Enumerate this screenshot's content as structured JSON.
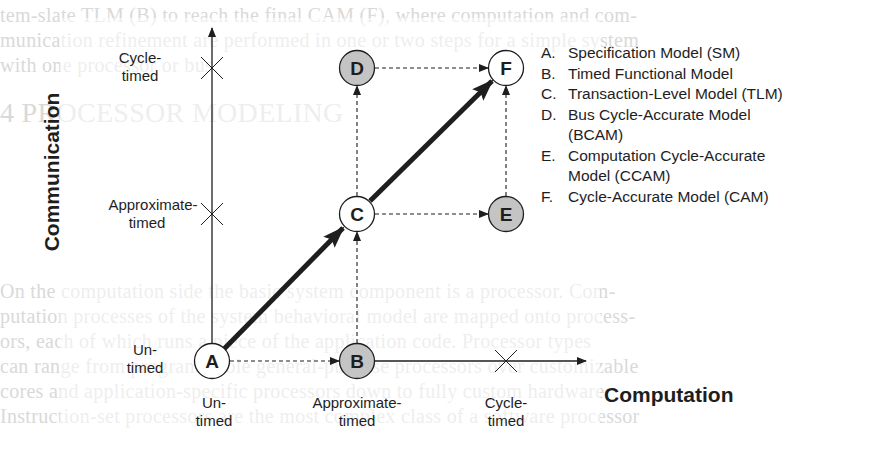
{
  "background_text": {
    "lines": [
      {
        "y": 3,
        "text": "tem-slate TLM (B) to reach the final CAM (F), where computation and com-"
      },
      {
        "y": 28,
        "text": "munication refinement are performed in one or two steps for a simple system"
      },
      {
        "y": 53,
        "text": "with one processor or bus."
      },
      {
        "y": 100,
        "text": "4    PROCESSOR MODELING"
      },
      {
        "y": 279,
        "text": "On the computation side the basic system component is a processor. Com-"
      },
      {
        "y": 304,
        "text": "putation processes of the system behavioral model are mapped onto process-"
      },
      {
        "y": 329,
        "text": "ors, each of which runs a piece of the application code. Processor types"
      },
      {
        "y": 354,
        "text": "can range from programmable general-purpose processors over customizable"
      },
      {
        "y": 379,
        "text": "cores and application-specific processors down to fully custom hardware."
      },
      {
        "y": 404,
        "text": "Instruction-set processors are the most complex class of a software processor"
      }
    ]
  },
  "axes": {
    "y_title": "Communication",
    "x_title": "Computation",
    "y_ticks": [
      {
        "line1": "Cycle-",
        "line2": "timed"
      },
      {
        "line1": "Approximate-",
        "line2": "timed"
      },
      {
        "line1": "Un-",
        "line2": "timed"
      }
    ],
    "x_ticks": [
      {
        "line1": "Un-",
        "line2": "timed"
      },
      {
        "line1": "Approximate-",
        "line2": "timed"
      },
      {
        "line1": "Cycle-",
        "line2": "timed"
      }
    ]
  },
  "nodes": [
    {
      "id": "A",
      "label": "A",
      "fill": "#ffffff"
    },
    {
      "id": "B",
      "label": "B",
      "fill": "#c4c4c4"
    },
    {
      "id": "C",
      "label": "C",
      "fill": "#ffffff"
    },
    {
      "id": "D",
      "label": "D",
      "fill": "#c4c4c4"
    },
    {
      "id": "E",
      "label": "E",
      "fill": "#c4c4c4"
    },
    {
      "id": "F",
      "label": "F",
      "fill": "#ffffff"
    }
  ],
  "edges": [
    {
      "from": "A",
      "to": "C",
      "style": "bold"
    },
    {
      "from": "C",
      "to": "F",
      "style": "bold"
    },
    {
      "from": "A",
      "to": "B",
      "style": "dashed"
    },
    {
      "from": "B",
      "to": "C",
      "style": "dashed"
    },
    {
      "from": "C",
      "to": "D",
      "style": "dashed"
    },
    {
      "from": "C",
      "to": "E",
      "style": "dashed"
    },
    {
      "from": "D",
      "to": "F",
      "style": "dashed"
    },
    {
      "from": "E",
      "to": "F",
      "style": "dashed"
    }
  ],
  "legend": [
    {
      "key": "A.",
      "text": "Specification Model (SM)"
    },
    {
      "key": "B.",
      "text": "Timed Functional Model"
    },
    {
      "key": "C.",
      "text": "Transaction-Level Model (TLM)"
    },
    {
      "key": "D.",
      "text": "Bus Cycle-Accurate Model (BCAM)"
    },
    {
      "key": "E.",
      "text": "Computation Cycle-Accurate Model (CCAM)"
    },
    {
      "key": "F.",
      "text": "Cycle-Accurate Model (CAM)"
    }
  ],
  "colors": {
    "ink": "#1e1e1e",
    "gray_node": "#c4c4c4",
    "ghost_text": "#d9d9d9"
  }
}
